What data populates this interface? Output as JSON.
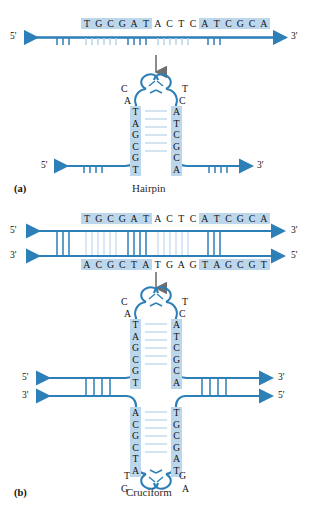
{
  "figure": {
    "colors": {
      "strand_blue": "#2d7fb8",
      "highlight_blue": "#bcd7ec",
      "rung_light": "#c5dcee",
      "arrow_gray": "#8a8a8a",
      "text_black": "#111111",
      "background": "#ffffff"
    }
  },
  "panel_a": {
    "label": "(a)",
    "caption": "Hairpin",
    "linear": {
      "five_prime": "5'",
      "three_prime": "3'",
      "segments": [
        {
          "seq": "TGCGAT",
          "highlighted": true,
          "name": "inverted-repeat-left"
        },
        {
          "seq": "ACTC",
          "highlighted": false,
          "name": "loop-spacer"
        },
        {
          "seq": "ATCGCA",
          "highlighted": true,
          "name": "inverted-repeat-right"
        }
      ],
      "full_sequence": "TGCGATACTCATCGCA"
    },
    "hairpin": {
      "five_prime": "5'",
      "three_prime": "3'",
      "loop_left_outer": "C",
      "loop_left_inner": "A",
      "loop_right_outer": "T",
      "loop_right_inner": "C",
      "stem_left": [
        "T",
        "A",
        "G",
        "C",
        "G",
        "T"
      ],
      "stem_right": [
        "A",
        "T",
        "C",
        "G",
        "C",
        "A"
      ],
      "base_pairs": 6
    }
  },
  "panel_b": {
    "label": "(b)",
    "caption": "Cruciform",
    "duplex": {
      "top_five_prime": "5'",
      "top_three_prime": "3'",
      "bottom_three_prime": "3'",
      "bottom_five_prime": "5'",
      "top_segments": [
        {
          "seq": "TGCGAT",
          "highlighted": true
        },
        {
          "seq": "ACTC",
          "highlighted": false
        },
        {
          "seq": "ATCGCA",
          "highlighted": true
        }
      ],
      "bottom_segments": [
        {
          "seq": "ACGCTA",
          "highlighted": true
        },
        {
          "seq": "TGAG",
          "highlighted": false
        },
        {
          "seq": "TAGCGT",
          "highlighted": true
        }
      ],
      "top_full_sequence": "TGCGATACTCATCGCA",
      "bottom_full_sequence": "ACGCTATGAGTAGCGT"
    },
    "cruciform": {
      "arm_left_top": "5'",
      "arm_right_top": "3'",
      "arm_left_bottom": "3'",
      "arm_right_bottom": "5'",
      "upper_hairpin": {
        "loop_left_outer": "C",
        "loop_left_inner": "A",
        "loop_right_outer": "T",
        "loop_right_inner": "C",
        "stem_left": [
          "T",
          "A",
          "G",
          "C",
          "G",
          "T"
        ],
        "stem_right": [
          "A",
          "T",
          "C",
          "G",
          "C",
          "A"
        ],
        "base_pairs": 6
      },
      "lower_hairpin": {
        "stem_left": [
          "A",
          "C",
          "G",
          "C",
          "T",
          "A"
        ],
        "stem_right": [
          "T",
          "G",
          "C",
          "G",
          "A",
          "T"
        ],
        "loop_left_inner": "T",
        "loop_left_outer": "G",
        "loop_right_inner": "G",
        "loop_right_outer": "A",
        "base_pairs": 6
      }
    }
  }
}
